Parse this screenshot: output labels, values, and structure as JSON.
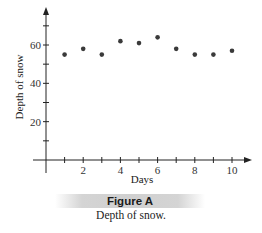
{
  "chart_data": {
    "type": "scatter",
    "title": "",
    "xlabel": "Days",
    "ylabel": "Depth of snow",
    "xlim": [
      0,
      10
    ],
    "ylim": [
      0,
      70
    ],
    "x_ticks": [
      1,
      2,
      3,
      4,
      5,
      6,
      7,
      8,
      9,
      10
    ],
    "x_tick_labels": [
      "",
      "2",
      "",
      "4",
      "",
      "6",
      "",
      "8",
      "",
      "10"
    ],
    "y_ticks": [
      10,
      20,
      30,
      40,
      50,
      60,
      70
    ],
    "y_tick_labels": [
      "",
      "20",
      "",
      "40",
      "",
      "60",
      ""
    ],
    "grid": false,
    "series": [
      {
        "name": "Depth of snow",
        "x": [
          1,
          2,
          3,
          4,
          5,
          6,
          7,
          8,
          9,
          10
        ],
        "y": [
          55,
          58,
          55,
          62,
          61,
          64,
          58,
          55,
          55,
          57
        ]
      }
    ],
    "colors": {
      "axis": "#222222",
      "point": "#3a3a3a"
    }
  },
  "figure": {
    "label": "Figure A",
    "caption": "Depth of snow."
  }
}
